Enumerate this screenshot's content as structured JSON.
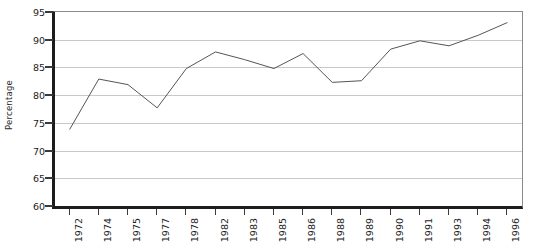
{
  "chart_data": {
    "type": "line",
    "title": "",
    "xlabel": "",
    "ylabel": "Percentage",
    "ylim": [
      60,
      95
    ],
    "yticks": [
      60,
      65,
      70,
      75,
      80,
      85,
      90,
      95
    ],
    "grid": true,
    "legend": "none",
    "line_color": "#555555",
    "categories": [
      "1972",
      "1974",
      "1975",
      "1977",
      "1978",
      "1982",
      "1983",
      "1985",
      "1986",
      "1988",
      "1989",
      "1990",
      "1991",
      "1993",
      "1994",
      "1996"
    ],
    "values": [
      73.8,
      82.9,
      81.9,
      77.7,
      84.8,
      87.8,
      86.4,
      84.8,
      87.5,
      82.3,
      82.6,
      88.3,
      89.8,
      88.9,
      90.8,
      93.1
    ]
  }
}
